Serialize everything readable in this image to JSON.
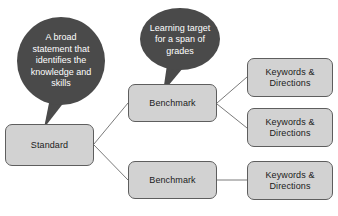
{
  "diagram": {
    "type": "hierarchy-flowchart",
    "colors": {
      "bubble_fill": "#4a4a4a",
      "bubble_text": "#ffffff",
      "box_fill": "#d2d2d2",
      "box_border": "#5e5e5e",
      "box_text": "#1b1b1b",
      "connector": "#6b6b6b",
      "background": "#ffffff"
    },
    "callouts": [
      {
        "id": "standard-callout",
        "shape": "circle",
        "text": "A broad\nstatement that\nidentifies the\nknowledge and\nskills",
        "points_to": "Standard"
      },
      {
        "id": "benchmark-callout",
        "shape": "ellipse",
        "text": "Learning target\nfor a span of\ngrades",
        "points_to": "Benchmark"
      }
    ],
    "nodes": {
      "standard": {
        "label": "Standard"
      },
      "benchmark_top": {
        "label": "Benchmark"
      },
      "benchmark_bottom": {
        "label": "Benchmark"
      },
      "keywords_1": {
        "label": "Keywords &\nDirections"
      },
      "keywords_2": {
        "label": "Keywords &\nDirections"
      },
      "keywords_3": {
        "label": "Keywords &\nDirections"
      }
    },
    "connections": [
      {
        "from": "standard",
        "to": "benchmark_top"
      },
      {
        "from": "standard",
        "to": "benchmark_bottom"
      },
      {
        "from": "benchmark_top",
        "to": "keywords_1"
      },
      {
        "from": "benchmark_top",
        "to": "keywords_2"
      },
      {
        "from": "benchmark_bottom",
        "to": "keywords_3"
      }
    ]
  }
}
